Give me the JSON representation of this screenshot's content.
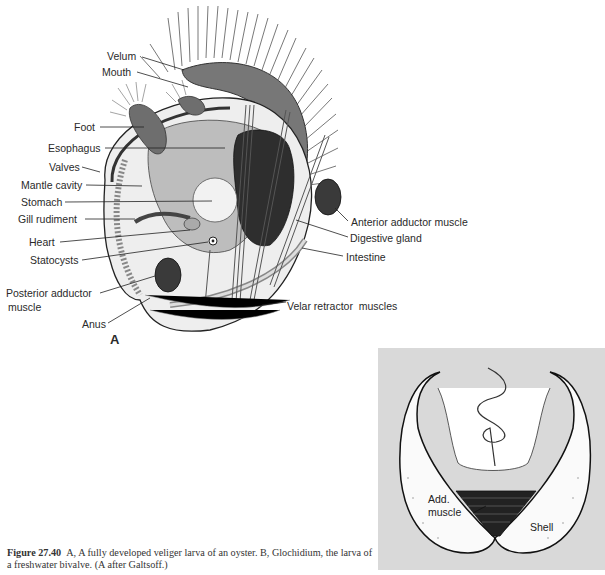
{
  "figure": {
    "panel_a": {
      "letter": "A",
      "labels": {
        "velum": "Velum",
        "mouth": "Mouth",
        "foot": "Foot",
        "esophagus": "Esophagus",
        "valves": "Valves",
        "mantle_cavity": "Mantle cavity",
        "stomach": "Stomach",
        "gill_rudiment": "Gill rudiment",
        "heart": "Heart",
        "statocysts": "Statocysts",
        "posterior_adductor_1": "Posterior adductor",
        "posterior_adductor_2": "muscle",
        "anus": "Anus",
        "anterior_adductor": "Anterior adductor muscle",
        "digestive_gland": "Digestive gland",
        "intestine": "Intestine",
        "velar_retractor": "Velar retractor  muscles"
      }
    },
    "panel_b": {
      "labels": {
        "add_muscle_1": "Add.",
        "add_muscle_2": "muscle",
        "shell": "Shell"
      }
    },
    "caption": {
      "number": "Figure 27.40",
      "text": "A, A fully developed veliger larva of an oyster. B, Glochidium, the larva of a freshwater bivalve. (A after Galtsoff.)"
    }
  }
}
